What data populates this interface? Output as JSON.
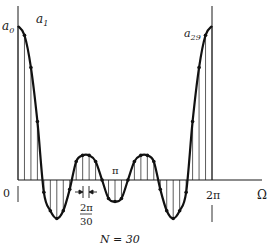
{
  "figure": {
    "labels": {
      "a0": "a",
      "a0_sub": "0",
      "a1": "a",
      "a1_sub": "1",
      "a29": "a",
      "a29_sub": "29",
      "pi": "π",
      "zero": "0",
      "two_pi": "2π",
      "omega": "Ω",
      "spacing_num": "2π",
      "spacing_den": "30",
      "caption": "N = 30"
    },
    "colors": {
      "ink": "#1a1a1a",
      "stems": "#333333",
      "background": "#ffffff"
    }
  },
  "chart_data": {
    "type": "line",
    "title": "",
    "caption": "N = 30",
    "xlabel": "Ω",
    "ylabel": "",
    "x_ticks": [
      "0",
      "π",
      "2π"
    ],
    "xlim": [
      0,
      6.2832
    ],
    "sample_spacing_label": "2π/30",
    "n_samples": 30,
    "annotations": [
      "a0",
      "a1",
      "a29",
      "2π/30"
    ],
    "series": [
      {
        "name": "frequency samples a_k",
        "k": [
          0,
          1,
          2,
          3,
          4,
          5,
          6,
          7,
          8,
          9,
          10,
          11,
          12,
          13,
          14,
          15,
          16,
          17,
          18,
          19,
          20,
          21,
          22,
          23,
          24,
          25,
          26,
          27,
          28,
          29,
          30
        ],
        "values": [
          1.0,
          0.94,
          0.73,
          0.38,
          -0.08,
          -0.2,
          -0.25,
          -0.2,
          -0.06,
          0.12,
          0.16,
          0.16,
          0.12,
          0.0,
          -0.12,
          -0.14,
          -0.12,
          0.0,
          0.12,
          0.16,
          0.16,
          0.12,
          -0.06,
          -0.2,
          -0.25,
          -0.2,
          -0.08,
          0.38,
          0.73,
          0.94,
          1.0
        ]
      }
    ],
    "grid": false,
    "legend": "none"
  }
}
